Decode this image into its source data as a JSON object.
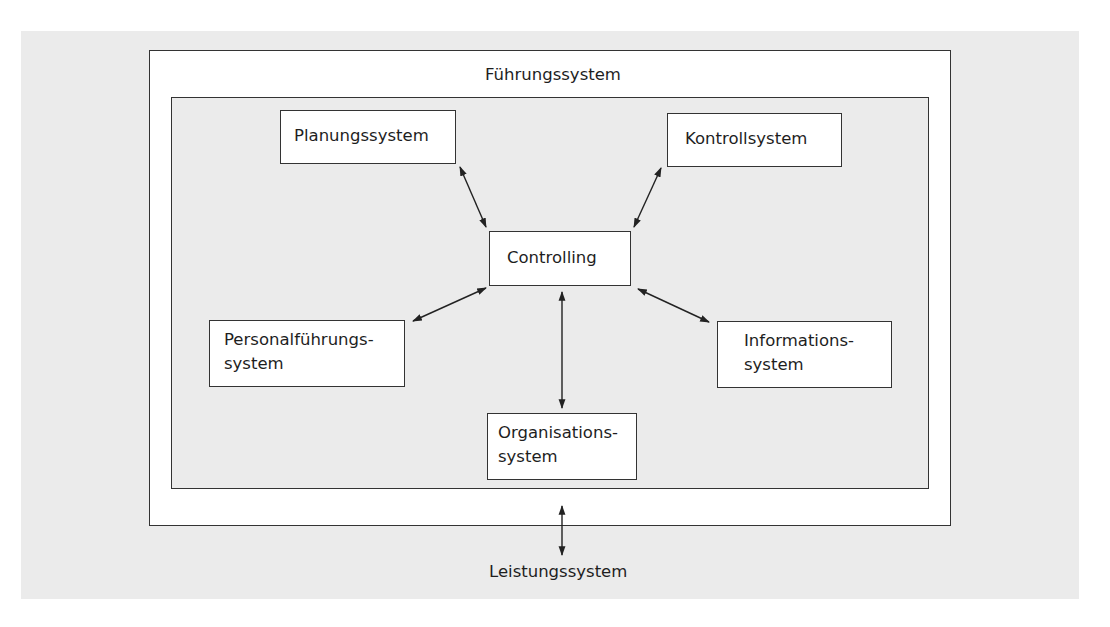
{
  "diagram": {
    "outer_label": "Führungssystem",
    "bottom_label": "Leistungssystem",
    "nodes": {
      "planung": "Planungssystem",
      "kontroll": "Kontrollsystem",
      "controlling": "Controlling",
      "personal_line1": "Personalführungs-",
      "personal_line2": "system",
      "information_line1": "Informations-",
      "information_line2": "system",
      "organisation_line1": "Organisations-",
      "organisation_line2": "system"
    },
    "edges": [
      {
        "from": "Planungssystem",
        "to": "Controlling",
        "type": "bidirectional"
      },
      {
        "from": "Kontrollsystem",
        "to": "Controlling",
        "type": "bidirectional"
      },
      {
        "from": "Personalführungssystem",
        "to": "Controlling",
        "type": "bidirectional"
      },
      {
        "from": "Informationssystem",
        "to": "Controlling",
        "type": "bidirectional"
      },
      {
        "from": "Organisationssystem",
        "to": "Controlling",
        "type": "bidirectional"
      },
      {
        "from": "Führungssystem",
        "to": "Leistungssystem",
        "type": "bidirectional"
      }
    ],
    "colors": {
      "background": "#ebebeb",
      "box_fill": "#ffffff",
      "stroke": "#333333"
    }
  }
}
